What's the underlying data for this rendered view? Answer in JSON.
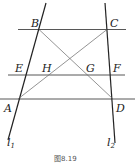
{
  "figure": {
    "caption": "图8.19",
    "points": {
      "A": "A",
      "B": "B",
      "C": "C",
      "D": "D",
      "E": "E",
      "F": "F",
      "G": "G",
      "H": "H"
    },
    "lines": {
      "l1": {
        "letter": "l",
        "sub": "1"
      },
      "l2": {
        "letter": "l",
        "sub": "2"
      }
    },
    "colors": {
      "stroke": "#222222",
      "thin": "#555555"
    }
  }
}
